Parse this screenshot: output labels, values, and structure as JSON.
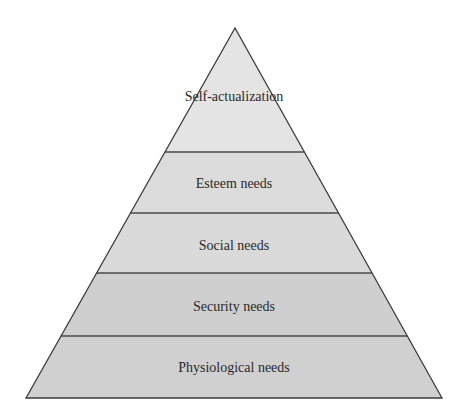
{
  "diagram": {
    "type": "pyramid",
    "apex": {
      "x": 235,
      "y": 28
    },
    "base_y": 398,
    "base_left_x": 26,
    "base_right_x": 442,
    "tiers": [
      {
        "label": "Self-actualization",
        "top_y": 28,
        "bottom_y": 152,
        "fill": "#e4e4e4",
        "label_y": 101
      },
      {
        "label": "Esteem needs",
        "top_y": 152,
        "bottom_y": 213,
        "fill": "#dcdcdc",
        "label_y": 188
      },
      {
        "label": "Social needs",
        "top_y": 213,
        "bottom_y": 273,
        "fill": "#dadada",
        "label_y": 250
      },
      {
        "label": "Security needs",
        "top_y": 273,
        "bottom_y": 336,
        "fill": "#cfcfcf",
        "label_y": 311
      },
      {
        "label": "Physiological needs",
        "top_y": 336,
        "bottom_y": 398,
        "fill": "#d0d0d0",
        "label_y": 372
      }
    ],
    "colors": {
      "outline": "#3a3a3a",
      "divider": "#4a4a4a",
      "text": "#2a2a2a",
      "background": "#ffffff"
    }
  }
}
